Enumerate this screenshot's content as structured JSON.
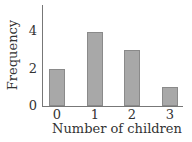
{
  "chart_data": {
    "type": "bar",
    "title": "",
    "xlabel": "Number of children",
    "ylabel": "Frequency",
    "categories": [
      "0",
      "1",
      "2",
      "3"
    ],
    "values": [
      2,
      4,
      3,
      1
    ],
    "yticks": [
      "0",
      "2",
      "4"
    ],
    "ylim": [
      0,
      5.3
    ],
    "grid": false,
    "legend": null,
    "bar_color": "#a8a8a8"
  }
}
